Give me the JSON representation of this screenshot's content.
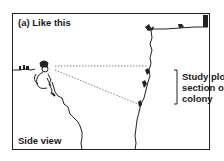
{
  "diagram": {
    "panel_title": "(a) Like this",
    "view_label": "Side view",
    "annotation": {
      "lines": [
        "Study plot/",
        "section of",
        "colony"
      ]
    },
    "elements": {
      "observer": "person-seated-on-left-cliff-ledge",
      "left_cliff": "jagged-cliff-face",
      "right_cliff": "jagged-cliff-face-with-birds",
      "sight_lines": "dotted-lines-from-observer-to-study-plot",
      "bracket": "vertical-bracket-marking-study-plot"
    },
    "colors": {
      "line": "#222222",
      "dotted": "#666666",
      "background": "#ffffff"
    }
  }
}
